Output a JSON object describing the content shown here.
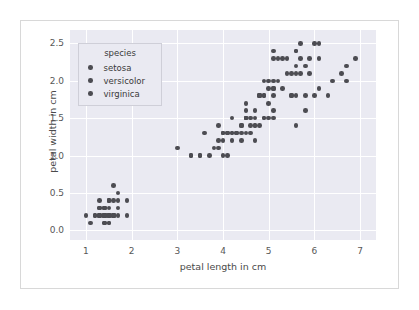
{
  "chart_data": {
    "type": "scatter",
    "title": "",
    "xlabel": "petal length in cm",
    "ylabel": "petal width in cm",
    "xlim": [
      0.65,
      7.35
    ],
    "ylim": [
      -0.13,
      2.68
    ],
    "xticks": [
      "1",
      "2",
      "3",
      "4",
      "5",
      "6",
      "7"
    ],
    "xtick_values": [
      1,
      2,
      3,
      4,
      5,
      6,
      7
    ],
    "yticks": [
      "0.0",
      "0.5",
      "1.0",
      "1.5",
      "2.0",
      "2.5"
    ],
    "ytick_values": [
      0.0,
      0.5,
      1.0,
      1.5,
      2.0,
      2.5
    ],
    "grid": true,
    "grid_color": "#ffffff",
    "plot_bg": "#eaeaf2",
    "marker_color": "#4c4c52",
    "legend": {
      "title": "species",
      "position": "upper-left",
      "entries": [
        {
          "label": "setosa",
          "color": "#4c4c52"
        },
        {
          "label": "versicolor",
          "color": "#4c4c52"
        },
        {
          "label": "virginica",
          "color": "#4c4c52"
        }
      ]
    },
    "series": [
      {
        "name": "setosa",
        "color": "#4c4c52",
        "points": [
          [
            1.4,
            0.2
          ],
          [
            1.4,
            0.2
          ],
          [
            1.3,
            0.2
          ],
          [
            1.5,
            0.2
          ],
          [
            1.4,
            0.2
          ],
          [
            1.7,
            0.4
          ],
          [
            1.4,
            0.3
          ],
          [
            1.5,
            0.2
          ],
          [
            1.4,
            0.2
          ],
          [
            1.5,
            0.1
          ],
          [
            1.5,
            0.2
          ],
          [
            1.6,
            0.2
          ],
          [
            1.4,
            0.1
          ],
          [
            1.1,
            0.1
          ],
          [
            1.2,
            0.2
          ],
          [
            1.5,
            0.4
          ],
          [
            1.3,
            0.4
          ],
          [
            1.4,
            0.3
          ],
          [
            1.7,
            0.3
          ],
          [
            1.5,
            0.3
          ],
          [
            1.7,
            0.2
          ],
          [
            1.5,
            0.4
          ],
          [
            1.0,
            0.2
          ],
          [
            1.7,
            0.5
          ],
          [
            1.9,
            0.2
          ],
          [
            1.6,
            0.2
          ],
          [
            1.6,
            0.4
          ],
          [
            1.5,
            0.2
          ],
          [
            1.4,
            0.2
          ],
          [
            1.6,
            0.2
          ],
          [
            1.6,
            0.2
          ],
          [
            1.5,
            0.4
          ],
          [
            1.5,
            0.1
          ],
          [
            1.4,
            0.2
          ],
          [
            1.5,
            0.2
          ],
          [
            1.2,
            0.2
          ],
          [
            1.3,
            0.2
          ],
          [
            1.4,
            0.1
          ],
          [
            1.3,
            0.2
          ],
          [
            1.5,
            0.2
          ],
          [
            1.3,
            0.3
          ],
          [
            1.3,
            0.3
          ],
          [
            1.3,
            0.2
          ],
          [
            1.6,
            0.6
          ],
          [
            1.9,
            0.4
          ],
          [
            1.4,
            0.3
          ],
          [
            1.6,
            0.2
          ],
          [
            1.4,
            0.2
          ],
          [
            1.5,
            0.2
          ],
          [
            1.4,
            0.2
          ]
        ]
      },
      {
        "name": "versicolor",
        "color": "#4c4c52",
        "points": [
          [
            4.7,
            1.4
          ],
          [
            4.5,
            1.5
          ],
          [
            4.9,
            1.5
          ],
          [
            4.0,
            1.3
          ],
          [
            4.6,
            1.5
          ],
          [
            4.5,
            1.3
          ],
          [
            4.7,
            1.6
          ],
          [
            3.3,
            1.0
          ],
          [
            4.6,
            1.3
          ],
          [
            3.9,
            1.4
          ],
          [
            3.5,
            1.0
          ],
          [
            4.2,
            1.5
          ],
          [
            4.0,
            1.0
          ],
          [
            4.7,
            1.4
          ],
          [
            3.6,
            1.3
          ],
          [
            4.4,
            1.4
          ],
          [
            4.5,
            1.5
          ],
          [
            4.1,
            1.0
          ],
          [
            4.5,
            1.5
          ],
          [
            3.9,
            1.1
          ],
          [
            4.8,
            1.8
          ],
          [
            4.0,
            1.3
          ],
          [
            4.9,
            1.5
          ],
          [
            4.7,
            1.2
          ],
          [
            4.3,
            1.3
          ],
          [
            4.4,
            1.4
          ],
          [
            4.8,
            1.4
          ],
          [
            5.0,
            1.7
          ],
          [
            4.5,
            1.5
          ],
          [
            3.5,
            1.0
          ],
          [
            3.8,
            1.1
          ],
          [
            3.7,
            1.0
          ],
          [
            3.9,
            1.2
          ],
          [
            5.1,
            1.6
          ],
          [
            4.5,
            1.5
          ],
          [
            4.5,
            1.6
          ],
          [
            4.7,
            1.5
          ],
          [
            4.4,
            1.3
          ],
          [
            4.1,
            1.3
          ],
          [
            4.0,
            1.3
          ],
          [
            4.4,
            1.2
          ],
          [
            4.6,
            1.4
          ],
          [
            4.0,
            1.2
          ],
          [
            3.3,
            1.0
          ],
          [
            4.2,
            1.3
          ],
          [
            4.2,
            1.2
          ],
          [
            4.2,
            1.3
          ],
          [
            4.3,
            1.3
          ],
          [
            3.0,
            1.1
          ],
          [
            4.1,
            1.3
          ]
        ]
      },
      {
        "name": "virginica",
        "color": "#4c4c52",
        "points": [
          [
            6.0,
            2.5
          ],
          [
            5.1,
            1.9
          ],
          [
            5.9,
            2.1
          ],
          [
            5.6,
            1.8
          ],
          [
            5.8,
            2.2
          ],
          [
            6.6,
            2.1
          ],
          [
            4.5,
            1.7
          ],
          [
            6.3,
            1.8
          ],
          [
            5.8,
            1.8
          ],
          [
            6.1,
            2.5
          ],
          [
            5.1,
            2.0
          ],
          [
            5.3,
            1.9
          ],
          [
            5.5,
            2.1
          ],
          [
            5.0,
            2.0
          ],
          [
            5.1,
            2.4
          ],
          [
            5.3,
            2.3
          ],
          [
            5.5,
            1.8
          ],
          [
            6.7,
            2.2
          ],
          [
            6.9,
            2.3
          ],
          [
            5.0,
            1.5
          ],
          [
            5.7,
            2.3
          ],
          [
            4.9,
            2.0
          ],
          [
            6.7,
            2.0
          ],
          [
            4.9,
            1.8
          ],
          [
            5.7,
            2.1
          ],
          [
            6.0,
            1.8
          ],
          [
            4.8,
            1.8
          ],
          [
            4.9,
            1.8
          ],
          [
            5.6,
            2.1
          ],
          [
            5.8,
            1.6
          ],
          [
            6.1,
            1.9
          ],
          [
            6.4,
            2.0
          ],
          [
            5.6,
            2.2
          ],
          [
            5.1,
            1.5
          ],
          [
            5.6,
            1.4
          ],
          [
            6.1,
            2.3
          ],
          [
            5.6,
            2.4
          ],
          [
            5.5,
            1.8
          ],
          [
            4.8,
            1.8
          ],
          [
            5.4,
            2.1
          ],
          [
            5.6,
            2.4
          ],
          [
            5.1,
            2.3
          ],
          [
            5.1,
            1.9
          ],
          [
            5.9,
            2.3
          ],
          [
            5.7,
            2.5
          ],
          [
            5.2,
            2.3
          ],
          [
            5.0,
            1.9
          ],
          [
            5.2,
            2.0
          ],
          [
            5.4,
            2.3
          ],
          [
            5.1,
            1.8
          ]
        ]
      }
    ]
  }
}
